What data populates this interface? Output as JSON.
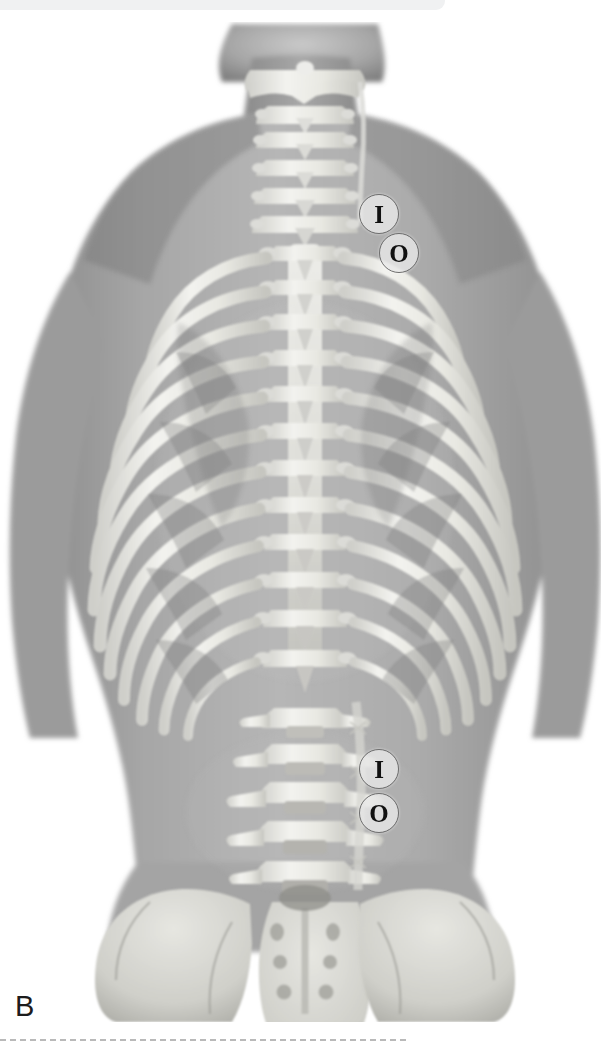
{
  "figure": {
    "panel_label": "B",
    "view": "posterior view of human torso with vertebral column and rib cage",
    "top_band_color": "#f0f1f2",
    "background_color": "#ffffff",
    "bone_color": "#e8e8e6",
    "skin_color": "#a9a9a9"
  },
  "markers": {
    "thoracic": [
      {
        "id": "thoracic-insertion",
        "label": "I",
        "x": 378,
        "y": 213
      },
      {
        "id": "thoracic-origin",
        "label": "O",
        "x": 398,
        "y": 252
      }
    ],
    "lumbar": [
      {
        "id": "lumbar-insertion",
        "label": "I",
        "x": 378,
        "y": 768
      },
      {
        "id": "lumbar-origin",
        "label": "O",
        "x": 378,
        "y": 812
      }
    ]
  },
  "separator": {
    "style": "dashed",
    "color": "#b9b9b9",
    "y": 1039,
    "width": 406
  },
  "regions": [
    {
      "name": "cervical-spine",
      "vertebrae": 7
    },
    {
      "name": "thoracic-spine",
      "vertebrae": 12,
      "rib_pairs": 12
    },
    {
      "name": "lumbar-spine",
      "vertebrae": 5
    },
    {
      "name": "sacrum",
      "foramina_pairs": 4
    },
    {
      "name": "pelvis",
      "parts": "left and right iliac wings"
    }
  ]
}
